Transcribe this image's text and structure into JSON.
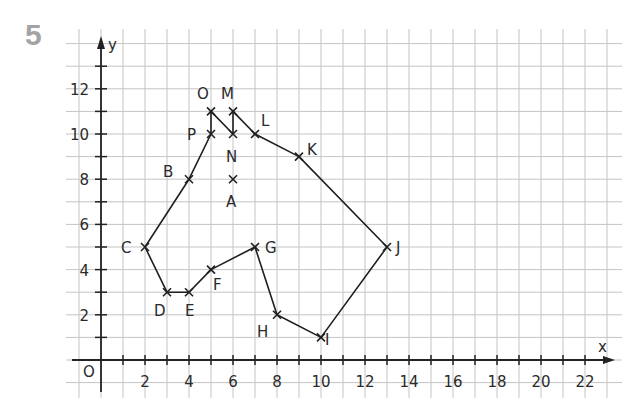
{
  "exercise_number": "5",
  "chart_data": {
    "type": "scatter",
    "title": "",
    "xlabel": "x",
    "ylabel": "y",
    "origin_label": "O",
    "xlim": [
      -1.5,
      23.5
    ],
    "ylim": [
      -1.5,
      14.5
    ],
    "x_tick_labels": [
      "2",
      "4",
      "6",
      "8",
      "10",
      "12",
      "14",
      "16",
      "18",
      "20",
      "22"
    ],
    "y_tick_labels": [
      "2",
      "4",
      "6",
      "8",
      "10",
      "12"
    ],
    "grid": true,
    "points": [
      {
        "label": "A",
        "x": 6,
        "y": 8
      },
      {
        "label": "B",
        "x": 4,
        "y": 8
      },
      {
        "label": "C",
        "x": 2,
        "y": 5
      },
      {
        "label": "D",
        "x": 3,
        "y": 3
      },
      {
        "label": "E",
        "x": 4,
        "y": 3
      },
      {
        "label": "F",
        "x": 5,
        "y": 4
      },
      {
        "label": "G",
        "x": 7,
        "y": 5
      },
      {
        "label": "H",
        "x": 8,
        "y": 2
      },
      {
        "label": "I",
        "x": 10,
        "y": 1
      },
      {
        "label": "J",
        "x": 13,
        "y": 5
      },
      {
        "label": "K",
        "x": 9,
        "y": 9
      },
      {
        "label": "L",
        "x": 7,
        "y": 10
      },
      {
        "label": "M",
        "x": 6,
        "y": 11
      },
      {
        "label": "N",
        "x": 6,
        "y": 10
      },
      {
        "label": "O",
        "x": 5,
        "y": 11
      },
      {
        "label": "P",
        "x": 5,
        "y": 10
      }
    ],
    "path_order": [
      "B",
      "C",
      "D",
      "E",
      "F",
      "G",
      "H",
      "I",
      "J",
      "K",
      "L",
      "M",
      "N",
      "O",
      "P",
      "B"
    ]
  }
}
